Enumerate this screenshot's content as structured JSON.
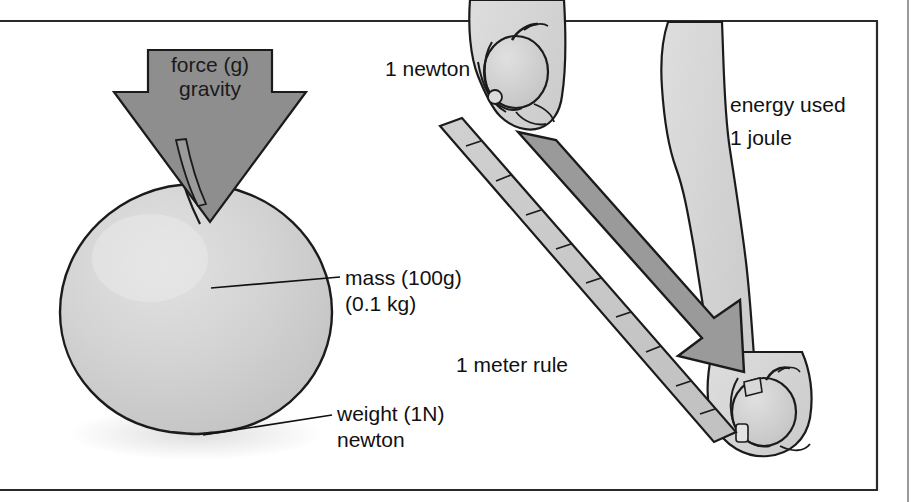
{
  "figure": {
    "frame": {
      "border_color": "#1b1b1b",
      "background": "#ffffff"
    }
  },
  "colors": {
    "arrow_gravity_fill": "#8e8e8e",
    "arrow_force_fill": "#9a9a9a",
    "apple_fill": "#d2d2d2",
    "apple_highlight": "#e6e6e6",
    "hand_fill": "#d6d6d6",
    "ruler_fill": "#c9c9c9",
    "outline": "#1b1b1b",
    "text": "#111111",
    "shadow": "#e3e3e3"
  },
  "labels": {
    "force_gravity_line1": "force (g)",
    "force_gravity_line2": "gravity",
    "mass_line1": "mass (100g)",
    "mass_line2": "(0.1 kg)",
    "weight_line1": "weight (1N)",
    "weight_line2": "newton",
    "one_newton": "1 newton",
    "energy_line1": "energy used",
    "energy_line2": "1 joule",
    "meter_rule": "1 meter rule"
  },
  "annotations": [
    {
      "name": "force-gravity-arrow",
      "text": "force (g) gravity",
      "points_to": "apple-top",
      "direction": "down"
    },
    {
      "name": "mass-leader",
      "text": "mass (100g) (0.1 kg)",
      "points_to": "apple-centre"
    },
    {
      "name": "weight-leader",
      "text": "weight (1N) newton",
      "points_to": "apple-bottom"
    },
    {
      "name": "one-newton-label",
      "text": "1 newton",
      "points_to": "upper-hand-holding-apple"
    },
    {
      "name": "energy-used-label",
      "text": "energy used 1 joule",
      "points_to": "lowering-arm"
    },
    {
      "name": "meter-rule-label",
      "text": "1 meter rule",
      "points_to": "ruler"
    }
  ],
  "objects": {
    "apple_large": {
      "name": "apple",
      "mass": "100g",
      "weight": "1N"
    },
    "ruler": {
      "name": "1 meter rule",
      "tick_count": 9
    },
    "upper_hand": {
      "name": "hand-holding-apple-top"
    },
    "lower_hand": {
      "name": "hand-holding-apple-bottom"
    },
    "motion_arrow": {
      "name": "downward-motion-arrow",
      "direction": "down-right"
    }
  }
}
